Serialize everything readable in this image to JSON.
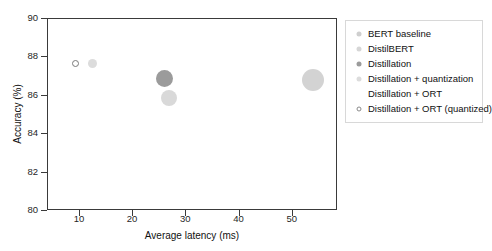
{
  "chart_data": {
    "type": "scatter",
    "title": "",
    "xlabel": "Average latency (ms)",
    "ylabel": "Accuracy (%)",
    "xlim": [
      4,
      58.5
    ],
    "ylim": [
      80,
      90
    ],
    "xticks": [
      10,
      20,
      30,
      40,
      50
    ],
    "ytick_labels": [
      "80",
      "82",
      "84",
      "86",
      "88",
      "90"
    ],
    "yticks": [
      80,
      82,
      84,
      86,
      88,
      90
    ],
    "grid": false,
    "legend_position": "right-outside",
    "bubble_size_meaning": "model size",
    "series": [
      {
        "name": "BERT baseline",
        "x": 54.0,
        "y": 86.75,
        "size_px": 22,
        "color": "#d3d3d3",
        "marker": "filled-circle"
      },
      {
        "name": "DistilBERT",
        "x": 27.0,
        "y": 85.85,
        "size_px": 16,
        "color": "#d9d9d9",
        "marker": "filled-circle"
      },
      {
        "name": "Distillation",
        "x": 26.0,
        "y": 86.85,
        "size_px": 17,
        "color": "#9b9b9b",
        "marker": "filled-circle"
      },
      {
        "name": "Distillation + quantization",
        "x": 12.5,
        "y": 87.65,
        "size_px": 9,
        "color": "#dcdcdc",
        "marker": "filled-circle"
      },
      {
        "name": "Distillation + ORT",
        "x": null,
        "y": null,
        "size_px": 0,
        "color": "#ffffff",
        "marker": "none"
      },
      {
        "name": "Distillation + ORT (quantized)",
        "x": 9.3,
        "y": 87.65,
        "size_px": 7,
        "color": "#ffffff",
        "edge_color": "#7a7a7a",
        "marker": "open-circle"
      }
    ]
  },
  "legend": {
    "entries": [
      {
        "label": "BERT baseline",
        "swatch": "#cfcfcf",
        "style": "filled",
        "size": 5
      },
      {
        "label": "DistilBERT",
        "swatch": "#d6d6d6",
        "style": "filled",
        "size": 5
      },
      {
        "label": "Distillation",
        "swatch": "#9b9b9b",
        "style": "filled",
        "size": 5
      },
      {
        "label": "Distillation + quantization",
        "swatch": "#dcdcdc",
        "style": "filled",
        "size": 5
      },
      {
        "label": "Distillation + ORT",
        "swatch": "#ffffff",
        "style": "none",
        "size": 5
      },
      {
        "label": "Distillation + ORT (quantized)",
        "swatch": "#ffffff",
        "style": "open",
        "size": 5
      }
    ]
  },
  "axes": {
    "x_title": "Average latency (ms)",
    "y_title": "Accuracy (%)",
    "x_tick_labels": [
      "10",
      "20",
      "30",
      "40",
      "50"
    ],
    "y_tick_labels": [
      "80",
      "82",
      "84",
      "86",
      "88",
      "90"
    ]
  },
  "colors": {
    "axis": "#3a3a3a",
    "text": "#111111",
    "legend_border": "#d8d8d8",
    "background": "#ffffff"
  }
}
